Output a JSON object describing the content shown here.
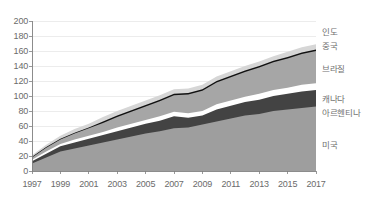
{
  "chart_data": {
    "type": "area",
    "stacked": true,
    "title": "",
    "subtitle": "",
    "xlabel": "",
    "ylabel": "",
    "xlim": [
      1997,
      2017
    ],
    "ylim": [
      0,
      200
    ],
    "ytick_step": 20,
    "xtick_step": 2,
    "grid": true,
    "legend_position": "right-inline",
    "x": [
      1997,
      1998,
      1999,
      2000,
      2001,
      2002,
      2003,
      2004,
      2005,
      2006,
      2007,
      2008,
      2009,
      2010,
      2011,
      2012,
      2013,
      2014,
      2015,
      2016,
      2017
    ],
    "xtick_labels": [
      "1997",
      "1999",
      "2001",
      "2003",
      "2005",
      "2007",
      "2009",
      "2011",
      "2013",
      "2015",
      "2017"
    ],
    "ytick_labels": [
      "0",
      "20",
      "40",
      "60",
      "80",
      "100",
      "120",
      "140",
      "160",
      "180",
      "200"
    ],
    "series": [
      {
        "name": "미국",
        "name_en": "United States",
        "color": "#9e9e9e",
        "values": [
          10,
          18,
          26,
          30,
          34,
          38,
          42,
          46,
          50,
          53,
          57,
          58,
          62,
          66,
          70,
          74,
          76,
          80,
          82,
          84,
          86
        ]
      },
      {
        "name": "아르헨티나",
        "name_en": "Argentina",
        "color": "#434343",
        "values": [
          3,
          5,
          7,
          8,
          9,
          10,
          11,
          12,
          13,
          14,
          16,
          13,
          12,
          16,
          17,
          18,
          19,
          20,
          21,
          22,
          22
        ]
      },
      {
        "name": "캐나다",
        "name_en": "Canada",
        "color": "#ffffff",
        "values": [
          2,
          3,
          3,
          4,
          4,
          4,
          5,
          5,
          5,
          6,
          6,
          6,
          6,
          7,
          7,
          7,
          8,
          8,
          8,
          9,
          9
        ]
      },
      {
        "name": "브라질",
        "name_en": "Brazil",
        "color": "#a6a6a6",
        "values": [
          3,
          5,
          6,
          8,
          10,
          12,
          14,
          16,
          18,
          20,
          22,
          25,
          27,
          29,
          31,
          33,
          35,
          37,
          39,
          41,
          43
        ]
      },
      {
        "name": "중국",
        "name_en": "China",
        "color": "#111111",
        "values": [
          1,
          1,
          1,
          1,
          1,
          2,
          2,
          2,
          2,
          2,
          2,
          2,
          2,
          2,
          2,
          2,
          2,
          2,
          2,
          2,
          2
        ]
      },
      {
        "name": "인도",
        "name_en": "India",
        "color": "#d6d6d6",
        "values": [
          2,
          3,
          4,
          5,
          5,
          6,
          6,
          6,
          6,
          6,
          6,
          6,
          6,
          6,
          6,
          6,
          6,
          6,
          7,
          7,
          7
        ]
      }
    ],
    "totals": [
      21,
      35,
      47,
      56,
      63,
      72,
      80,
      87,
      94,
      101,
      109,
      110,
      115,
      126,
      133,
      140,
      146,
      153,
      159,
      165,
      169
    ]
  },
  "legend": {
    "items": [
      {
        "label": "인도"
      },
      {
        "label": "중국"
      },
      {
        "label": "브라질"
      },
      {
        "label": "캐나다"
      },
      {
        "label": "아르헨티나"
      },
      {
        "label": "미국"
      }
    ]
  }
}
